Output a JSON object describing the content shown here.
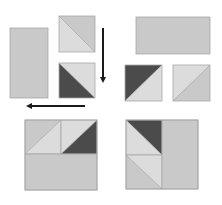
{
  "diagram": {
    "colors": {
      "light": "#dcdcdc",
      "medium": "#c9c9c9",
      "dark": "#4b4b4b",
      "border": "#a8a8a8",
      "arrow": "#1a1a1a"
    },
    "pieces": [
      {
        "id": "tall-rectangle",
        "shape": "rectangle",
        "x": 10,
        "y": 28,
        "w": 38,
        "h": 70,
        "fill": "medium"
      },
      {
        "id": "hst-top",
        "shape": "half-square-triangle",
        "x": 59,
        "y": 16,
        "w": 36,
        "h": 36,
        "diagonal": "tl-br",
        "triangles": {
          "upper_right": "medium",
          "lower_left": "light"
        }
      },
      {
        "id": "hst-bottom",
        "shape": "half-square-triangle",
        "x": 59,
        "y": 63,
        "w": 36,
        "h": 35,
        "diagonal": "tl-br",
        "triangles": {
          "upper_right": "light",
          "lower_left": "dark"
        }
      },
      {
        "id": "wide-rectangle",
        "shape": "rectangle",
        "x": 136,
        "y": 17,
        "w": 74,
        "h": 37,
        "fill": "medium"
      },
      {
        "id": "hst-right-a",
        "shape": "half-square-triangle",
        "x": 125,
        "y": 65,
        "w": 37,
        "h": 36,
        "diagonal": "bl-tr",
        "triangles": {
          "upper_left": "dark",
          "lower_right": "light"
        }
      },
      {
        "id": "hst-right-b",
        "shape": "half-square-triangle",
        "x": 173,
        "y": 65,
        "w": 37,
        "h": 36,
        "diagonal": "bl-tr",
        "triangles": {
          "upper_left": "light",
          "lower_right": "medium"
        }
      }
    ],
    "arrows": [
      {
        "id": "arrow-down",
        "x1": 103,
        "y1": 28,
        "x2": 103,
        "y2": 80
      },
      {
        "id": "arrow-left",
        "x1": 85,
        "y1": 106,
        "x2": 29,
        "y2": 106
      }
    ],
    "assembled_blocks": [
      {
        "id": "block-left",
        "x": 25,
        "y": 120,
        "w": 72,
        "h": 70,
        "cells": [
          {
            "x": 25,
            "y": 120,
            "w": 36,
            "h": 34,
            "diagonal": "bl-tr",
            "tri_a": "medium",
            "tri_b": "light"
          },
          {
            "x": 61,
            "y": 120,
            "w": 36,
            "h": 34,
            "diagonal": "bl-tr",
            "tri_a": "light",
            "tri_b": "dark"
          },
          {
            "x": 25,
            "y": 154,
            "w": 72,
            "h": 36,
            "rect": "medium"
          }
        ]
      },
      {
        "id": "block-right",
        "x": 126,
        "y": 120,
        "w": 72,
        "h": 69,
        "cells": [
          {
            "x": 126,
            "y": 120,
            "w": 36,
            "h": 35,
            "diagonal": "tl-br",
            "tri_a": "dark",
            "tri_b": "light"
          },
          {
            "x": 126,
            "y": 155,
            "w": 36,
            "h": 34,
            "diagonal": "tl-br",
            "tri_a": "light",
            "tri_b": "medium"
          },
          {
            "x": 162,
            "y": 120,
            "w": 36,
            "h": 69,
            "rect": "medium"
          }
        ]
      }
    ]
  }
}
